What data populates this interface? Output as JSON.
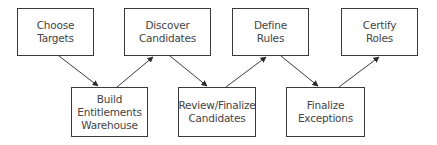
{
  "diagram": {
    "type": "process-flow",
    "nodes": [
      {
        "id": "choose-targets",
        "label": "Choose\nTargets",
        "row": "top",
        "x": 17,
        "y": 8,
        "w": 77,
        "h": 48
      },
      {
        "id": "build-entitlements-warehouse",
        "label": "Build\nEntitlements\nWarehouse",
        "row": "bottom",
        "x": 71,
        "y": 87,
        "w": 77,
        "h": 50
      },
      {
        "id": "discover-candidates",
        "label": "Discover\nCandidates",
        "row": "top",
        "x": 124,
        "y": 8,
        "w": 87,
        "h": 48
      },
      {
        "id": "review-finalize-candidates",
        "label": "Review/Finalize\nCandidates",
        "row": "bottom",
        "x": 178,
        "y": 87,
        "w": 78,
        "h": 50
      },
      {
        "id": "define-rules",
        "label": "Define\nRules",
        "row": "top",
        "x": 232,
        "y": 8,
        "w": 77,
        "h": 48
      },
      {
        "id": "finalize-exceptions",
        "label": "Finalize\nExceptions",
        "row": "bottom",
        "x": 286,
        "y": 87,
        "w": 79,
        "h": 50
      },
      {
        "id": "certify-roles",
        "label": "Certify\nRoles",
        "row": "top",
        "x": 341,
        "y": 8,
        "w": 77,
        "h": 48
      }
    ],
    "edges": [
      {
        "from": "choose-targets",
        "to": "build-entitlements-warehouse",
        "x1": 59,
        "y1": 56,
        "x2": 98,
        "y2": 86
      },
      {
        "from": "build-entitlements-warehouse",
        "to": "discover-candidates",
        "x1": 117,
        "y1": 87,
        "x2": 153,
        "y2": 57
      },
      {
        "from": "discover-candidates",
        "to": "review-finalize-candidates",
        "x1": 170,
        "y1": 56,
        "x2": 207,
        "y2": 86
      },
      {
        "from": "review-finalize-candidates",
        "to": "define-rules",
        "x1": 226,
        "y1": 87,
        "x2": 266,
        "y2": 57
      },
      {
        "from": "define-rules",
        "to": "finalize-exceptions",
        "x1": 281,
        "y1": 56,
        "x2": 318,
        "y2": 86
      },
      {
        "from": "finalize-exceptions",
        "to": "certify-roles",
        "x1": 339,
        "y1": 87,
        "x2": 379,
        "y2": 57
      }
    ],
    "colors": {
      "stroke": "#3a3a3a",
      "text": "#444444",
      "background": "#ffffff"
    }
  }
}
